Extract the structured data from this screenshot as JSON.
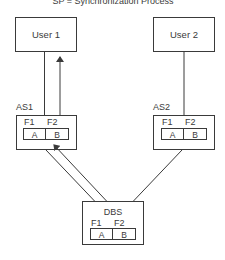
{
  "caption": "SP = Synchronization Process",
  "nodes": {
    "user1": {
      "label": "User 1"
    },
    "user2": {
      "label": "User 2"
    },
    "as1": {
      "label": "AS1",
      "fields": [
        "F1",
        "F2"
      ],
      "cells": [
        "A",
        "B"
      ]
    },
    "as2": {
      "label": "AS2",
      "fields": [
        "F1",
        "F2"
      ],
      "cells": [
        "A",
        "B"
      ]
    },
    "dbs": {
      "label": "DBS",
      "fields": [
        "F1",
        "F2"
      ],
      "cells": [
        "A",
        "B"
      ]
    }
  },
  "edges": [
    {
      "from": "as1",
      "to": "user1",
      "arrows": [
        "none",
        "to-user1"
      ]
    },
    {
      "from": "as2",
      "to": "user2",
      "arrows": [
        "none"
      ]
    },
    {
      "from": "dbs",
      "to": "as1",
      "arrows": [
        "none",
        "to-as1"
      ]
    },
    {
      "from": "dbs",
      "to": "as2",
      "arrows": [
        "none"
      ]
    }
  ],
  "colors": {
    "stroke": "#3a3a3a",
    "background": "#ffffff"
  }
}
